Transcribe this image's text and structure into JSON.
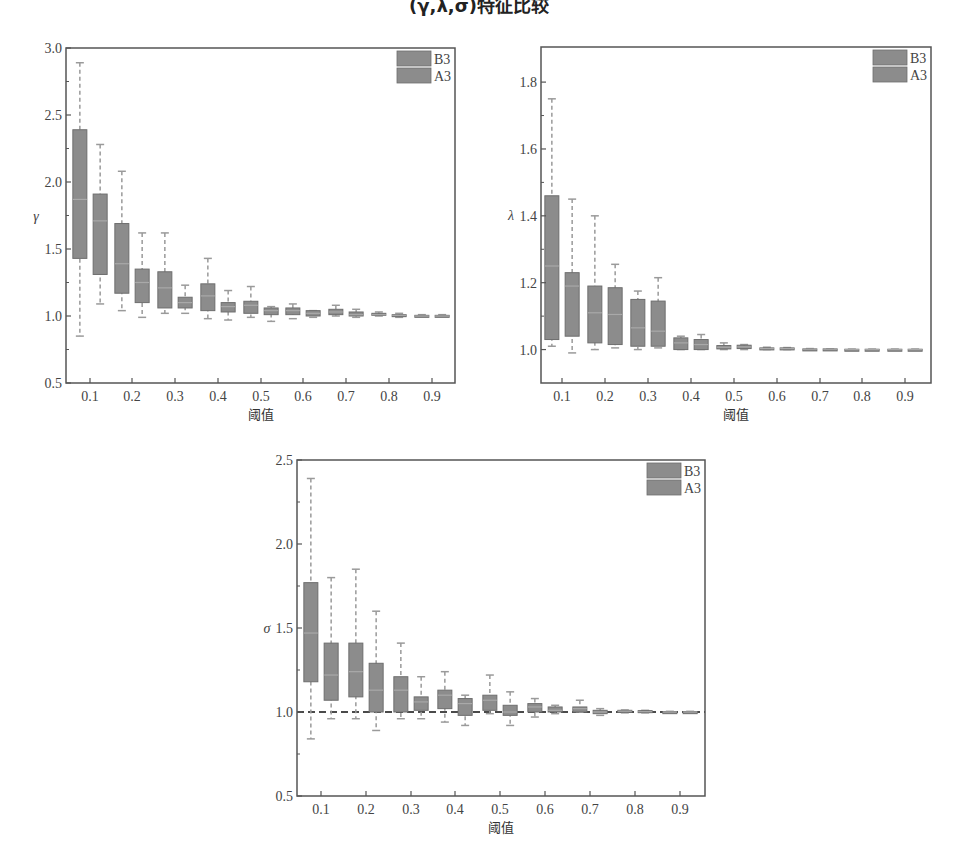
{
  "page": {
    "title": "(γ,λ,σ)特征比较"
  },
  "chart_data": [
    {
      "id": "gamma",
      "type": "box",
      "title": "",
      "xlabel": "阈值",
      "ylabel": "γ",
      "categories": [
        "0.1",
        "0.2",
        "0.3",
        "0.4",
        "0.5",
        "0.6",
        "0.7",
        "0.8",
        "0.9"
      ],
      "yticks": [
        0.5,
        1.0,
        1.5,
        2.0,
        2.5,
        3.0
      ],
      "ytick_labels": [
        "0.5",
        "1.0",
        "1.5",
        "2.0",
        "2.5",
        "3.0"
      ],
      "ylim": [
        0.5,
        3.0
      ],
      "reference_line": null,
      "legend": {
        "position": "upper right",
        "entries": [
          "B3",
          "A3"
        ]
      },
      "series": [
        {
          "name": "B3",
          "boxes": [
            {
              "min": 0.85,
              "q1": 1.43,
              "median": 1.87,
              "q3": 2.39,
              "max": 2.89
            },
            {
              "min": 1.04,
              "q1": 1.17,
              "median": 1.39,
              "q3": 1.69,
              "max": 2.08
            },
            {
              "min": 1.02,
              "q1": 1.06,
              "median": 1.21,
              "q3": 1.33,
              "max": 1.62
            },
            {
              "min": 0.98,
              "q1": 1.04,
              "median": 1.15,
              "q3": 1.24,
              "max": 1.43
            },
            {
              "min": 0.99,
              "q1": 1.02,
              "median": 1.08,
              "q3": 1.11,
              "max": 1.22
            },
            {
              "min": 0.98,
              "q1": 1.01,
              "median": 1.04,
              "q3": 1.06,
              "max": 1.09
            },
            {
              "min": 1.0,
              "q1": 1.01,
              "median": 1.03,
              "q3": 1.05,
              "max": 1.08
            },
            {
              "min": 1.0,
              "q1": 1.005,
              "median": 1.01,
              "q3": 1.02,
              "max": 1.03
            },
            {
              "min": 1.0,
              "q1": 1.0,
              "median": 1.0,
              "q3": 1.005,
              "max": 1.01
            }
          ]
        },
        {
          "name": "A3",
          "boxes": [
            {
              "min": 1.09,
              "q1": 1.31,
              "median": 1.71,
              "q3": 1.91,
              "max": 2.28
            },
            {
              "min": 0.99,
              "q1": 1.1,
              "median": 1.25,
              "q3": 1.35,
              "max": 1.62
            },
            {
              "min": 1.02,
              "q1": 1.06,
              "median": 1.1,
              "q3": 1.14,
              "max": 1.23
            },
            {
              "min": 0.97,
              "q1": 1.03,
              "median": 1.07,
              "q3": 1.1,
              "max": 1.19
            },
            {
              "min": 0.96,
              "q1": 1.01,
              "median": 1.04,
              "q3": 1.06,
              "max": 1.07
            },
            {
              "min": 0.99,
              "q1": 1.0,
              "median": 1.02,
              "q3": 1.04,
              "max": 1.04
            },
            {
              "min": 0.99,
              "q1": 1.0,
              "median": 1.01,
              "q3": 1.03,
              "max": 1.05
            },
            {
              "min": 0.99,
              "q1": 1.0,
              "median": 1.005,
              "q3": 1.01,
              "max": 1.02
            },
            {
              "min": 1.0,
              "q1": 1.0,
              "median": 1.0,
              "q3": 1.005,
              "max": 1.01
            }
          ]
        }
      ],
      "layout": {
        "left": 66,
        "top": 48,
        "right": 455,
        "bottom": 383,
        "tick_x": [
          90,
          132,
          175,
          218,
          261,
          303,
          346,
          389,
          432
        ]
      }
    },
    {
      "id": "lambda",
      "type": "box",
      "title": "",
      "xlabel": "阈值",
      "ylabel": "λ",
      "categories": [
        "0.1",
        "0.2",
        "0.3",
        "0.4",
        "0.5",
        "0.6",
        "0.7",
        "0.8",
        "0.9"
      ],
      "yticks": [
        1.0,
        1.2,
        1.4,
        1.6,
        1.8
      ],
      "ytick_labels": [
        "1.0",
        "1.2",
        "1.4",
        "1.6",
        "1.8"
      ],
      "ylim": [
        0.9,
        1.905
      ],
      "reference_line": null,
      "legend": {
        "position": "upper right",
        "entries": [
          "B3",
          "A3"
        ]
      },
      "series": [
        {
          "name": "B3",
          "boxes": [
            {
              "min": 1.01,
              "q1": 1.03,
              "median": 1.25,
              "q3": 1.46,
              "max": 1.75
            },
            {
              "min": 1.0,
              "q1": 1.02,
              "median": 1.11,
              "q3": 1.19,
              "max": 1.4
            },
            {
              "min": 1.0,
              "q1": 1.01,
              "median": 1.065,
              "q3": 1.15,
              "max": 1.175
            },
            {
              "min": 1.0,
              "q1": 1.0,
              "median": 1.02,
              "q3": 1.035,
              "max": 1.04
            },
            {
              "min": 1.0,
              "q1": 1.002,
              "median": 1.007,
              "q3": 1.012,
              "max": 1.02
            },
            {
              "min": 1.0,
              "q1": 1.001,
              "median": 1.003,
              "q3": 1.005,
              "max": 1.007
            },
            {
              "min": 1.0,
              "q1": 1.0,
              "median": 1.001,
              "q3": 1.002,
              "max": 1.003
            },
            {
              "min": 1.0,
              "q1": 1.0,
              "median": 1.0,
              "q3": 1.001,
              "max": 1.001
            },
            {
              "min": 1.0,
              "q1": 1.0,
              "median": 1.0,
              "q3": 1.001,
              "max": 1.001
            }
          ]
        },
        {
          "name": "A3",
          "boxes": [
            {
              "min": 0.99,
              "q1": 1.04,
              "median": 1.19,
              "q3": 1.23,
              "max": 1.45
            },
            {
              "min": 1.005,
              "q1": 1.015,
              "median": 1.105,
              "q3": 1.185,
              "max": 1.255
            },
            {
              "min": 1.005,
              "q1": 1.01,
              "median": 1.055,
              "q3": 1.145,
              "max": 1.215
            },
            {
              "min": 1.0,
              "q1": 1.0,
              "median": 1.015,
              "q3": 1.03,
              "max": 1.045
            },
            {
              "min": 1.0,
              "q1": 1.003,
              "median": 1.008,
              "q3": 1.013,
              "max": 1.015
            },
            {
              "min": 1.0,
              "q1": 1.001,
              "median": 1.003,
              "q3": 1.005,
              "max": 1.006
            },
            {
              "min": 1.0,
              "q1": 1.0,
              "median": 1.001,
              "q3": 1.002,
              "max": 1.002
            },
            {
              "min": 1.0,
              "q1": 1.0,
              "median": 1.0,
              "q3": 1.001,
              "max": 1.001
            },
            {
              "min": 1.0,
              "q1": 1.0,
              "median": 1.0,
              "q3": 1.001,
              "max": 1.001
            }
          ]
        }
      ],
      "layout": {
        "left": 541,
        "top": 47,
        "right": 931,
        "bottom": 383,
        "tick_x": [
          562,
          605,
          648,
          691,
          734,
          777,
          820,
          862,
          905
        ]
      }
    },
    {
      "id": "sigma",
      "type": "box",
      "title": "",
      "xlabel": "阈值",
      "ylabel": "σ",
      "categories": [
        "0.1",
        "0.2",
        "0.3",
        "0.4",
        "0.5",
        "0.6",
        "0.7",
        "0.8",
        "0.9"
      ],
      "yticks": [
        0.5,
        1.0,
        1.5,
        2.0,
        2.5
      ],
      "ytick_labels": [
        "0.5",
        "1.0",
        "1.5",
        "2.0",
        "2.5"
      ],
      "ylim": [
        0.5,
        2.5
      ],
      "reference_line": {
        "y": 1.0,
        "style": "dashed"
      },
      "legend": {
        "position": "upper right",
        "entries": [
          "B3",
          "A3"
        ]
      },
      "series": [
        {
          "name": "B3",
          "boxes": [
            {
              "min": 0.84,
              "q1": 1.18,
              "median": 1.47,
              "q3": 1.77,
              "max": 2.39
            },
            {
              "min": 0.96,
              "q1": 1.09,
              "median": 1.24,
              "q3": 1.41,
              "max": 1.85
            },
            {
              "min": 0.96,
              "q1": 1.0,
              "median": 1.13,
              "q3": 1.21,
              "max": 1.41
            },
            {
              "min": 0.94,
              "q1": 1.02,
              "median": 1.1,
              "q3": 1.13,
              "max": 1.24
            },
            {
              "min": 0.99,
              "q1": 1.01,
              "median": 1.07,
              "q3": 1.1,
              "max": 1.22
            },
            {
              "min": 0.97,
              "q1": 1.0,
              "median": 1.03,
              "q3": 1.05,
              "max": 1.08
            },
            {
              "min": 1.0,
              "q1": 1.0,
              "median": 1.02,
              "q3": 1.03,
              "max": 1.07
            },
            {
              "min": 0.995,
              "q1": 1.0,
              "median": 1.005,
              "q3": 1.01,
              "max": 1.012
            },
            {
              "min": 1.0,
              "q1": 1.0,
              "median": 1.0,
              "q3": 1.002,
              "max": 1.004
            }
          ]
        },
        {
          "name": "A3",
          "boxes": [
            {
              "min": 0.96,
              "q1": 1.07,
              "median": 1.22,
              "q3": 1.41,
              "max": 1.8
            },
            {
              "min": 0.89,
              "q1": 1.0,
              "median": 1.13,
              "q3": 1.29,
              "max": 1.6
            },
            {
              "min": 0.96,
              "q1": 1.01,
              "median": 1.06,
              "q3": 1.09,
              "max": 1.21
            },
            {
              "min": 0.92,
              "q1": 0.98,
              "median": 1.05,
              "q3": 1.08,
              "max": 1.1
            },
            {
              "min": 0.92,
              "q1": 0.98,
              "median": 1.0,
              "q3": 1.04,
              "max": 1.12
            },
            {
              "min": 0.99,
              "q1": 1.0,
              "median": 1.01,
              "q3": 1.03,
              "max": 1.04
            },
            {
              "min": 0.98,
              "q1": 0.99,
              "median": 1.0,
              "q3": 1.01,
              "max": 1.02
            },
            {
              "min": 0.995,
              "q1": 1.0,
              "median": 1.002,
              "q3": 1.008,
              "max": 1.01
            },
            {
              "min": 1.0,
              "q1": 1.0,
              "median": 1.0,
              "q3": 1.002,
              "max": 1.004
            }
          ]
        }
      ],
      "layout": {
        "left": 297,
        "top": 460,
        "right": 705,
        "bottom": 796,
        "tick_x": [
          321,
          366,
          411,
          455,
          500,
          545,
          590,
          635,
          680
        ]
      }
    }
  ],
  "style": {
    "box_fill": "#8c8c8c",
    "box_stroke": "#6e6e6e",
    "median_color": "#a9a9a9",
    "whisker_color": "#9a9a9a",
    "axis_color": "#555555",
    "reference_line_color": "#4a4a4a"
  }
}
